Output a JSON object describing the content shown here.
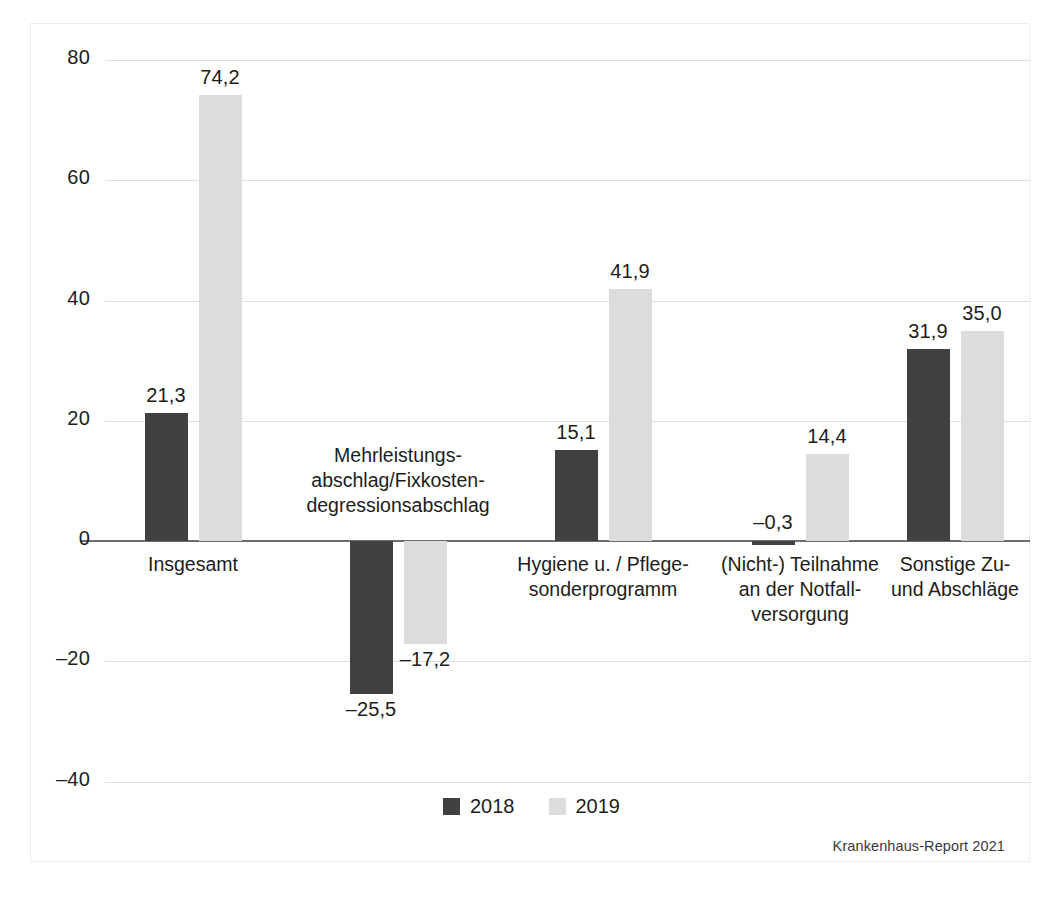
{
  "chart_data": {
    "type": "bar",
    "title": "",
    "subtitle": "",
    "xlabel": "",
    "ylabel": "",
    "ylim": [
      -40,
      80
    ],
    "yticks": [
      80,
      60,
      40,
      20,
      0,
      -20,
      -40
    ],
    "ytick_labels": [
      "80",
      "60",
      "40",
      "20",
      "0",
      "–20",
      "–40"
    ],
    "grid": true,
    "legend_position": "bottom-center",
    "categories": [
      "Insgesamt",
      "Mehrleistungs-\nabschlag/Fixkosten-\ndegressionsabschlag",
      "Hygiene u. / Pflege-\nsonderprogramm",
      "(Nicht-) Teilnahme\nan der Notfall-\nversorgung",
      "Sonstige Zu-\nund Abschläge"
    ],
    "series": [
      {
        "name": "2018",
        "color": "#414141",
        "values": [
          21.3,
          -25.5,
          15.1,
          -0.3,
          31.9
        ],
        "value_labels": [
          "21,3",
          "–25,5",
          "15,1",
          "–0,3",
          "31,9"
        ]
      },
      {
        "name": "2019",
        "color": "#dcdcdc",
        "values": [
          74.2,
          -17.2,
          41.9,
          14.4,
          35.0
        ],
        "value_labels": [
          "74,2",
          "–17,2",
          "41,9",
          "14,4",
          "35,0"
        ]
      }
    ]
  },
  "legend": {
    "items": [
      {
        "label": "2018",
        "color": "#414141"
      },
      {
        "label": "2019",
        "color": "#dcdcdc"
      }
    ]
  },
  "source": {
    "text": "Krankenhaus-Report 2021"
  },
  "colors": {
    "series_2018": "#414141",
    "series_2019": "#dcdcdc",
    "gridline": "#dedede",
    "zeroline": "#6e6e6e",
    "text": "#1d1d1b",
    "frame": "#ececed"
  }
}
